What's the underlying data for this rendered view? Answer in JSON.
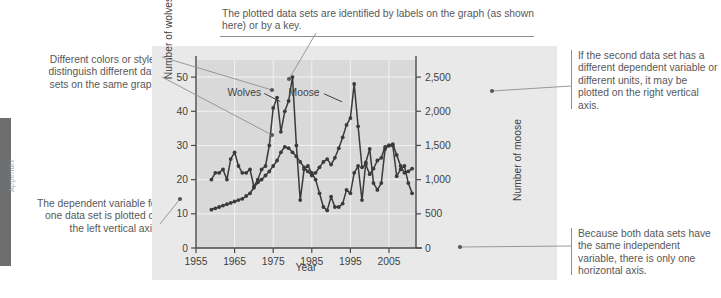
{
  "page": {
    "edge_tab_text": "Appendix"
  },
  "annotations": {
    "top": "The plotted data sets are identified by labels on the graph (as shown here) or by a key.",
    "top_left": "Different colors or styles distinguish different data sets on the same graph.",
    "bottom_left": "The dependent variable for one data set is plotted on the left vertical axis.",
    "top_right": "If the second data set has a different dependent variable or different units, it may be plotted on the right vertical axis.",
    "bottom_right": "Because both data sets have the same independent variable, there is only one horizontal axis."
  },
  "chart_data": {
    "type": "line",
    "title": "",
    "xlabel": "Year",
    "ylabel": "Number of wolves",
    "ylabel_right": "Number of moose",
    "xlim": [
      1955,
      2012
    ],
    "ylim": [
      0,
      55
    ],
    "ylim_right": [
      0,
      2750
    ],
    "xticks": [
      1955,
      1965,
      1975,
      1985,
      1995,
      2005
    ],
    "xtick_labels": [
      "1955",
      "1965",
      "1975",
      "1985",
      "1995",
      "2005"
    ],
    "yticks": [
      0,
      10,
      20,
      30,
      40,
      50
    ],
    "ytick_labels": [
      "0",
      "10",
      "20",
      "30",
      "40",
      "50"
    ],
    "yticks_right": [
      0,
      500,
      1000,
      1500,
      2000,
      2500
    ],
    "ytick_labels_right": [
      "0",
      "500",
      "1,000",
      "1,500",
      "2,000",
      "2,500"
    ],
    "grid": true,
    "legend_position": "inline-labels",
    "series": [
      {
        "name": "Wolves",
        "axis": "left",
        "color": "#3a3a3c",
        "label_x": 1967.5,
        "label_y": 45.5,
        "x": [
          1959,
          1960,
          1961,
          1962,
          1963,
          1964,
          1965,
          1966,
          1967,
          1968,
          1969,
          1970,
          1971,
          1972,
          1973,
          1974,
          1975,
          1976,
          1977,
          1978,
          1979,
          1980,
          1981,
          1982,
          1983,
          1984,
          1985,
          1986,
          1987,
          1988,
          1989,
          1990,
          1991,
          1992,
          1993,
          1994,
          1995,
          1996,
          1997,
          1998,
          1999,
          2000,
          2001,
          2002,
          2003,
          2004,
          2005,
          2006,
          2007,
          2008,
          2009,
          2010,
          2011
        ],
        "y": [
          20,
          22,
          22,
          23,
          20,
          26,
          28,
          24,
          22,
          22,
          23,
          18,
          20,
          23,
          24,
          30,
          41,
          44,
          34,
          40,
          43,
          50,
          30,
          14,
          23,
          24,
          22,
          20,
          16,
          12,
          11,
          15,
          12,
          12,
          13,
          17,
          16,
          22,
          24,
          14,
          25,
          29,
          19,
          17,
          19,
          29,
          30,
          30,
          21,
          23,
          24,
          19,
          16
        ]
      },
      {
        "name": "Moose",
        "axis": "right",
        "color": "#3a3a3c",
        "label_x": 1983.0,
        "label_y_right": 2270,
        "x": [
          1959,
          1960,
          1961,
          1962,
          1963,
          1964,
          1965,
          1966,
          1967,
          1968,
          1969,
          1970,
          1971,
          1972,
          1973,
          1974,
          1975,
          1976,
          1977,
          1978,
          1979,
          1980,
          1981,
          1982,
          1983,
          1984,
          1985,
          1986,
          1987,
          1988,
          1989,
          1990,
          1991,
          1992,
          1993,
          1994,
          1995,
          1996,
          1997,
          1998,
          1999,
          2000,
          2001,
          2002,
          2003,
          2004,
          2005,
          2006,
          2007,
          2008,
          2009,
          2010,
          2011
        ],
        "y_right": [
          560,
          580,
          600,
          620,
          640,
          660,
          680,
          700,
          720,
          760,
          800,
          880,
          960,
          1000,
          1060,
          1120,
          1200,
          1280,
          1400,
          1480,
          1460,
          1400,
          1340,
          1260,
          1180,
          1120,
          1060,
          1100,
          1180,
          1260,
          1300,
          1220,
          1320,
          1460,
          1620,
          1800,
          1900,
          2400,
          1780,
          1180,
          1220,
          1080,
          1160,
          1280,
          1320,
          1480,
          1500,
          1520,
          1360,
          1200,
          1100,
          1120,
          1160
        ]
      }
    ]
  }
}
